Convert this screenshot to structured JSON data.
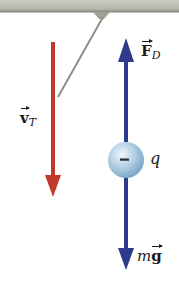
{
  "figure": {
    "type": "free-body diagram",
    "colors": {
      "ceiling": "#b9bdb1",
      "ceiling_edge": "#8e9387",
      "string": "#8a8f84",
      "velocity_arrow": "#c0392b",
      "force_arrow": "#2e3a8c",
      "sphere_light": "#e4f0f8",
      "sphere_dark": "#7fa9c6"
    },
    "ceiling": {
      "label": ""
    },
    "velocity": {
      "symbol": "v",
      "subscript": "T",
      "direction": "down"
    },
    "drag_force": {
      "symbol": "F",
      "subscript": "D",
      "direction": "up"
    },
    "gravity_force": {
      "prefix": "m",
      "symbol": "g",
      "direction": "down"
    },
    "charge": {
      "sign": "−",
      "label": "q"
    }
  }
}
